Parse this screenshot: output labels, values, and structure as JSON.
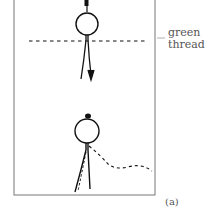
{
  "figure": {
    "panel_label": "(a)",
    "thread_label_line1": "green",
    "thread_label_line2": "thread",
    "colors": {
      "frame": "#777777",
      "ink": "#111111",
      "background": "#ffffff"
    }
  }
}
